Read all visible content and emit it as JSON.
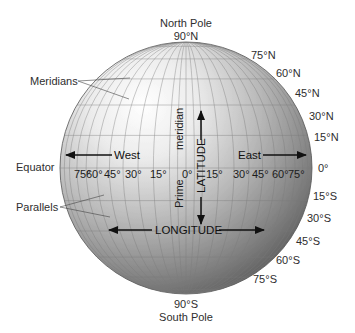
{
  "poles": {
    "north_name": "North Pole",
    "north_deg": "90°N",
    "south_deg": "90°S",
    "south_name": "South Pole"
  },
  "callouts": {
    "meridians": "Meridians",
    "equator": "Equator",
    "parallels": "Parallels"
  },
  "latitude_labels": {
    "north": [
      "75°N",
      "60°N",
      "45°N",
      "30°N",
      "15°N"
    ],
    "equator": "0°",
    "south": [
      "15°S",
      "30°S",
      "45°S",
      "60°S",
      "75°S"
    ]
  },
  "longitude_labels": {
    "west": [
      "75°",
      "60°",
      "45°",
      "30°",
      "15°"
    ],
    "zero": "0°",
    "east": [
      "15°",
      "30°",
      "45°",
      "60°",
      "75°"
    ]
  },
  "directions": {
    "west": "West",
    "east": "East"
  },
  "axis_labels": {
    "latitude": "LATITUDE",
    "longitude": "LONGITUDE",
    "prime": "Prime",
    "meridian": "meridian"
  },
  "colors": {
    "globe_light": "#ffffff",
    "globe_mid": "#b9b9b9",
    "globe_dark": "#5d5d5d",
    "grid": "#7a7a7a",
    "text": "#2e2e2e"
  }
}
